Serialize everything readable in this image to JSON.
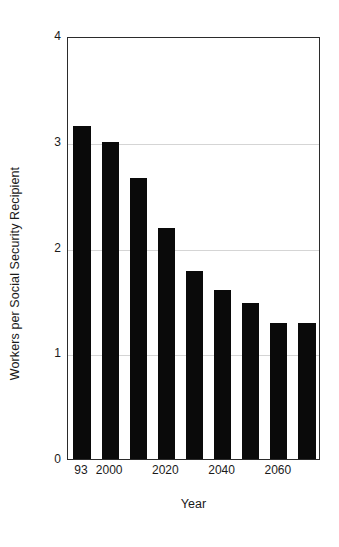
{
  "chart_data": {
    "type": "bar",
    "title": "",
    "subtitle": "",
    "xlabel": "Year",
    "ylabel": "Workers per Social Security Recipient",
    "categories": [
      "93",
      "2000",
      "2010",
      "2020",
      "2030",
      "2040",
      "2050",
      "2060",
      "2070"
    ],
    "tick_labels": [
      "93",
      "2000",
      "",
      "2020",
      "",
      "2040",
      "",
      "2060",
      ""
    ],
    "values": [
      3.15,
      3.0,
      2.66,
      2.18,
      1.78,
      1.6,
      1.48,
      1.29,
      1.29
    ],
    "ylim": [
      0,
      4
    ],
    "y_ticks": [
      0,
      1,
      2,
      3,
      4
    ],
    "y_tick_labels": [
      "0",
      "1",
      "2",
      "3",
      "4"
    ],
    "grid": true,
    "grid_axis": "y",
    "legend": "none",
    "bar_color": "#0a0a0a",
    "grid_color": "#d5d5d5",
    "axis_color": "#2b2b2b",
    "background": "#ffffff"
  }
}
